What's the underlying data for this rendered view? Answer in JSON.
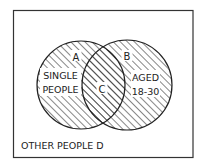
{
  "diagram": {
    "type": "venn",
    "universe_label": "OTHER PEOPLE D",
    "sets": [
      {
        "id": "A",
        "region_letter": "A",
        "label_lines": [
          "SINGLE",
          "PEOPLE"
        ]
      },
      {
        "id": "B",
        "region_letter": "B",
        "label_lines": [
          "AGED",
          "18-30"
        ]
      }
    ],
    "intersection": {
      "id": "C",
      "region_letter": "C"
    },
    "colors": {
      "stroke": "#222222",
      "hatch": "#222222",
      "background": "#ffffff"
    }
  }
}
